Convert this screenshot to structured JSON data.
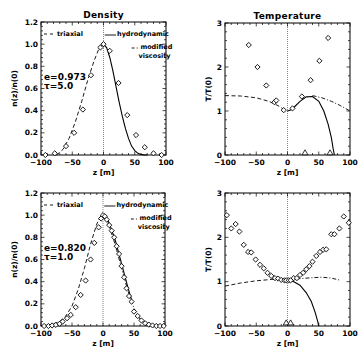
{
  "chart_data": [
    {
      "id": "density_top",
      "type": "line",
      "title": "Density",
      "xlabel": "z [m]",
      "ylabel": "n(z)/n(0)",
      "xlim": [
        -100,
        100
      ],
      "ylim": [
        0,
        1.2
      ],
      "xticks": [
        -100,
        -50,
        0,
        50,
        100
      ],
      "yticks": [
        0.0,
        0.2,
        0.4,
        0.6,
        0.8,
        1.0,
        1.2
      ],
      "ytick_labels": [
        "0.0",
        "0.2",
        "0.4",
        "0.6",
        "0.8",
        "1.0",
        "1.2"
      ],
      "frame": {
        "x0": 41,
        "y0": 22,
        "x1": 166,
        "y1": 155
      },
      "params": [
        "e=0.973",
        "τ=5.0"
      ],
      "legend": [
        {
          "label": "triaxial",
          "style": "dashed",
          "pos": "top-left"
        },
        {
          "label": "hydrodynamic",
          "style": "solid",
          "pos": "top-right"
        },
        {
          "label": "modified",
          "label2": "viscosity",
          "style": "dashdot",
          "pos": "right"
        }
      ],
      "series": [
        {
          "name": "triaxial",
          "style": "dashed",
          "x": [
            -75,
            -65,
            -55,
            -45,
            -35,
            -25,
            -15,
            -8,
            -3,
            0
          ],
          "y": [
            0.0,
            0.05,
            0.15,
            0.3,
            0.48,
            0.68,
            0.85,
            0.95,
            0.99,
            1.0
          ]
        },
        {
          "name": "hydrodynamic",
          "style": "solid",
          "x": [
            0,
            5,
            10,
            15,
            20,
            25,
            30,
            35,
            40,
            45,
            50,
            55,
            60,
            65,
            70
          ],
          "y": [
            1.0,
            0.97,
            0.88,
            0.76,
            0.62,
            0.48,
            0.35,
            0.24,
            0.15,
            0.08,
            0.04,
            0.015,
            0.005,
            0.0,
            0.0
          ]
        },
        {
          "name": "simulation",
          "style": "diamond",
          "x": [
            -93,
            -78,
            -60,
            -47,
            -33,
            -20,
            -5,
            0,
            10,
            24,
            38,
            52,
            66,
            80,
            93
          ],
          "y": [
            0.0,
            0.015,
            0.08,
            0.2,
            0.41,
            0.72,
            0.97,
            1.0,
            0.94,
            0.65,
            0.36,
            0.18,
            0.07,
            0.015,
            0.0
          ]
        }
      ]
    },
    {
      "id": "temperature_top",
      "type": "line",
      "title": "Temperature",
      "xlabel": "z [m]",
      "ylabel": "T/T(0)",
      "xlim": [
        -100,
        100
      ],
      "ylim": [
        0,
        3
      ],
      "xticks": [
        -100,
        -50,
        0,
        50,
        100
      ],
      "yticks": [
        0,
        1,
        2,
        3
      ],
      "ytick_labels": [
        "0",
        "1",
        "2",
        "3"
      ],
      "frame": {
        "x0": 225,
        "y0": 23,
        "x1": 350,
        "y1": 155
      },
      "series": [
        {
          "name": "triaxial",
          "style": "dashed",
          "x": [
            -100,
            -75,
            -50,
            -30,
            -15,
            -5,
            0
          ],
          "y": [
            1.35,
            1.34,
            1.3,
            1.22,
            1.12,
            1.03,
            1.0
          ]
        },
        {
          "name": "modified viscosity",
          "style": "dashdot",
          "x": [
            40,
            55,
            70,
            85,
            100
          ],
          "y": [
            1.35,
            1.3,
            1.22,
            1.12,
            1.0
          ]
        },
        {
          "name": "hydrodynamic",
          "style": "solid",
          "x": [
            0,
            5,
            10,
            20,
            30,
            40,
            50,
            58,
            65,
            70,
            73,
            75
          ],
          "y": [
            1.0,
            1.02,
            1.08,
            1.22,
            1.32,
            1.33,
            1.22,
            1.0,
            0.7,
            0.4,
            0.15,
            0.0
          ]
        },
        {
          "name": "simulation",
          "style": "diamond",
          "x": [
            -62,
            -48,
            -34,
            -21,
            -18,
            -6,
            8,
            23,
            37,
            51,
            65
          ],
          "y": [
            2.5,
            2.0,
            1.58,
            1.2,
            1.24,
            1.02,
            1.06,
            1.33,
            1.7,
            2.14,
            2.66
          ]
        },
        {
          "name": "simulation-low",
          "style": "triangle",
          "x": [
            28,
            68
          ],
          "y": [
            0.05,
            0.05
          ]
        }
      ]
    },
    {
      "id": "density_bottom",
      "type": "line",
      "title": "",
      "xlabel": "z [m]",
      "ylabel": "n(z)/n(0)",
      "xlim": [
        -100,
        100
      ],
      "ylim": [
        0,
        1.2
      ],
      "xticks": [
        -100,
        -50,
        0,
        50,
        100
      ],
      "yticks": [
        0.0,
        0.2,
        0.4,
        0.6,
        0.8,
        1.0,
        1.2
      ],
      "ytick_labels": [
        "0.0",
        "0.2",
        "0.4",
        "0.6",
        "0.8",
        "1.0",
        "1.2"
      ],
      "frame": {
        "x0": 41,
        "y0": 193,
        "x1": 165,
        "y1": 326
      },
      "params": [
        "e=0.820",
        "τ=1.0"
      ],
      "legend": [
        {
          "label": "triaxial",
          "style": "dashed",
          "pos": "top-left"
        },
        {
          "label": "hydrodynamic",
          "style": "solid",
          "pos": "top-right"
        },
        {
          "label": "modified",
          "label2": "viscosity",
          "style": "dashdot",
          "pos": "right"
        }
      ],
      "series": [
        {
          "name": "triaxial",
          "style": "dashed",
          "x": [
            -100,
            -85,
            -70,
            -60,
            -50,
            -40,
            -30,
            -20,
            -10,
            -5,
            0
          ],
          "y": [
            0.0,
            0.01,
            0.04,
            0.09,
            0.18,
            0.33,
            0.52,
            0.74,
            0.92,
            0.98,
            1.0
          ]
        },
        {
          "name": "hydrodynamic",
          "style": "solid",
          "x": [
            0,
            5,
            10,
            20,
            30,
            40,
            47
          ],
          "y": [
            1.0,
            0.98,
            0.93,
            0.77,
            0.56,
            0.35,
            0.22
          ]
        },
        {
          "name": "modified viscosity",
          "style": "dashdot",
          "x": [
            0,
            5,
            10,
            20,
            30,
            40,
            50,
            60,
            70,
            80,
            100
          ],
          "y": [
            1.0,
            0.97,
            0.9,
            0.73,
            0.52,
            0.32,
            0.16,
            0.06,
            0.02,
            0.005,
            0.0
          ]
        },
        {
          "name": "simulation",
          "style": "diamond",
          "x": [
            -95,
            -88,
            -82,
            -76,
            -70,
            -65,
            -58,
            -52,
            -44,
            -36,
            -28,
            -20,
            -14,
            -7,
            -3,
            0,
            3,
            6,
            10,
            14,
            18,
            22,
            26,
            30,
            34,
            38,
            42,
            46,
            50,
            56,
            62,
            68,
            74,
            80,
            86,
            92,
            98
          ],
          "y": [
            0.0,
            0.0,
            0.005,
            0.01,
            0.02,
            0.04,
            0.07,
            0.1,
            0.17,
            0.28,
            0.41,
            0.6,
            0.75,
            0.89,
            0.97,
            1.0,
            0.99,
            0.96,
            0.91,
            0.86,
            0.8,
            0.72,
            0.65,
            0.54,
            0.44,
            0.34,
            0.27,
            0.22,
            0.13,
            0.09,
            0.05,
            0.025,
            0.012,
            0.005,
            0.0,
            0.0,
            0.0
          ]
        }
      ]
    },
    {
      "id": "temperature_bottom",
      "type": "line",
      "title": "",
      "xlabel": "z [m]",
      "ylabel": "T/T(0)",
      "xlim": [
        -100,
        100
      ],
      "ylim": [
        0,
        3
      ],
      "xticks": [
        -100,
        -50,
        0,
        50,
        100
      ],
      "yticks": [
        0,
        1,
        2,
        3
      ],
      "ytick_labels": [
        "0",
        "1",
        "2",
        "3"
      ],
      "frame": {
        "x0": 225,
        "y0": 193,
        "x1": 350,
        "y1": 326
      },
      "series": [
        {
          "name": "triaxial",
          "style": "dashed",
          "x": [
            -100,
            -75,
            -50,
            -25,
            -10,
            0
          ],
          "y": [
            0.9,
            0.97,
            1.02,
            1.05,
            1.05,
            1.04
          ]
        },
        {
          "name": "modified viscosity",
          "style": "dashdot",
          "x": [
            0,
            20,
            40,
            55,
            70,
            85
          ],
          "y": [
            1.04,
            1.07,
            1.09,
            1.1,
            1.08,
            1.03
          ]
        },
        {
          "name": "hydrodynamic",
          "style": "solid",
          "x": [
            0,
            10,
            20,
            30,
            38,
            44,
            48,
            50
          ],
          "y": [
            1.04,
            1.0,
            0.92,
            0.75,
            0.55,
            0.32,
            0.12,
            0.0
          ]
        },
        {
          "name": "simulation",
          "style": "diamond",
          "x": [
            -97,
            -90,
            -83,
            -77,
            -70,
            -63,
            -58,
            -51,
            -44,
            -38,
            -32,
            -26,
            -20,
            -15,
            -10,
            -5,
            -2,
            2,
            5,
            10,
            15,
            20,
            25,
            30,
            35,
            40,
            46,
            52,
            57,
            62,
            70,
            75,
            83,
            90,
            98
          ],
          "y": [
            2.5,
            2.2,
            2.3,
            2.13,
            1.83,
            1.67,
            1.66,
            1.5,
            1.38,
            1.3,
            1.2,
            1.13,
            1.08,
            1.07,
            1.04,
            1.03,
            1.03,
            1.03,
            1.03,
            1.08,
            1.08,
            1.15,
            1.2,
            1.28,
            1.35,
            1.45,
            1.58,
            1.67,
            1.72,
            1.73,
            2.07,
            2.07,
            2.2,
            2.47,
            2.33
          ]
        },
        {
          "name": "simulation-low",
          "style": "triangle",
          "x": [
            -2,
            5
          ],
          "y": [
            0.07,
            0.07
          ]
        }
      ]
    }
  ]
}
